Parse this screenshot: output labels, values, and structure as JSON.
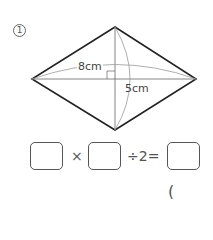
{
  "problem": {
    "number_label": "1",
    "diagonal_horizontal_label": "8cm",
    "diagonal_vertical_label": "5cm"
  },
  "equation": {
    "times_symbol": "×",
    "divide_by_text": "÷2=",
    "answer_paren": "("
  },
  "colors": {
    "line": "#222222",
    "thin_line": "#888888",
    "text": "#444444"
  }
}
